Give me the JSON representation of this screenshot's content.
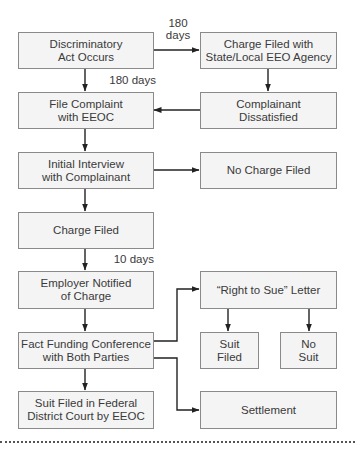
{
  "diagram": {
    "colors": {
      "box_fill": "#f4f4f4",
      "box_border": "#8a8a8a",
      "line": "#222222",
      "text": "#3a3a3a"
    },
    "nodes": {
      "discriminatory_act": "Discriminatory\nAct Occurs",
      "charge_state_local": "Charge Filed with\nState/Local EEO Agency",
      "file_complaint": "File Complaint\nwith EEOC",
      "complainant_dissatisfied": "Complainant\nDissatisfied",
      "initial_interview": "Initial Interview\nwith Complainant",
      "no_charge_filed": "No Charge Filed",
      "charge_filed": "Charge Filed",
      "employer_notified": "Employer Notified\nof Charge",
      "right_to_sue": "“Right to Sue” Letter",
      "fact_funding": "Fact Funding Conference\nwith Both Parties",
      "suit_filed": "Suit\nFiled",
      "no_suit": "No\nSuit",
      "suit_federal": "Suit Filed in Federal\nDistrict Court by EEOC",
      "settlement": "Settlement"
    },
    "edge_labels": {
      "to_state_agency": "180\ndays",
      "to_eeoc": "180 days",
      "to_employer": "10 days"
    },
    "edges": [
      {
        "from": "discriminatory_act",
        "to": "charge_state_local",
        "label": "180 days"
      },
      {
        "from": "discriminatory_act",
        "to": "file_complaint",
        "label": "180 days"
      },
      {
        "from": "charge_state_local",
        "to": "complainant_dissatisfied"
      },
      {
        "from": "complainant_dissatisfied",
        "to": "file_complaint"
      },
      {
        "from": "file_complaint",
        "to": "initial_interview"
      },
      {
        "from": "initial_interview",
        "to": "no_charge_filed"
      },
      {
        "from": "initial_interview",
        "to": "charge_filed"
      },
      {
        "from": "charge_filed",
        "to": "employer_notified",
        "label": "10 days"
      },
      {
        "from": "employer_notified",
        "to": "fact_funding"
      },
      {
        "from": "fact_funding",
        "to": "right_to_sue"
      },
      {
        "from": "fact_funding",
        "to": "settlement"
      },
      {
        "from": "fact_funding",
        "to": "suit_federal"
      },
      {
        "from": "right_to_sue",
        "to": "suit_filed"
      },
      {
        "from": "right_to_sue",
        "to": "no_suit"
      }
    ]
  }
}
